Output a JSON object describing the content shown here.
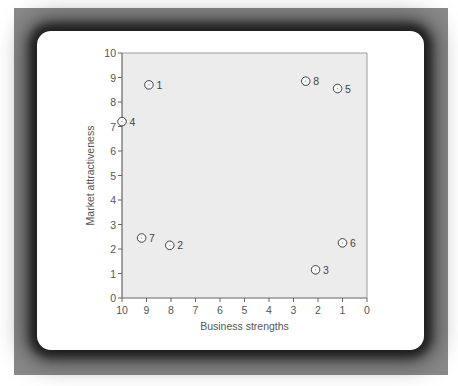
{
  "chart_data": {
    "type": "scatter",
    "title": "",
    "xlabel": "Business strengths",
    "ylabel": "Market attractiveness",
    "xlim": [
      10,
      0
    ],
    "ylim": [
      0,
      10
    ],
    "x_reversed": true,
    "xticks": [
      10,
      9,
      8,
      7,
      6,
      5,
      4,
      3,
      2,
      1,
      0
    ],
    "yticks": [
      0,
      1,
      2,
      3,
      4,
      5,
      6,
      7,
      8,
      9,
      10
    ],
    "grid": false,
    "legend": null,
    "points": [
      {
        "label": "1",
        "x": 8.9,
        "y": 8.7
      },
      {
        "label": "2",
        "x": 8.05,
        "y": 2.15
      },
      {
        "label": "3",
        "x": 2.1,
        "y": 1.15
      },
      {
        "label": "4",
        "x": 10.0,
        "y": 7.2
      },
      {
        "label": "5",
        "x": 1.2,
        "y": 8.55
      },
      {
        "label": "6",
        "x": 1.0,
        "y": 2.25
      },
      {
        "label": "7",
        "x": 9.2,
        "y": 2.45
      },
      {
        "label": "8",
        "x": 2.5,
        "y": 8.85
      }
    ]
  },
  "colors": {
    "frame": "#8a8a8a",
    "card": "#ffffff",
    "plot_bg": "#ececec",
    "axis": "#666666",
    "marker_stroke": "#444444",
    "text": "#555555"
  }
}
